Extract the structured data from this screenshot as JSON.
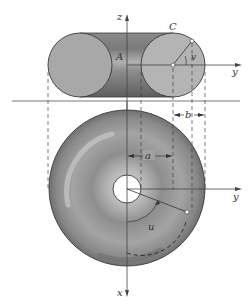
{
  "figure": {
    "type": "torus-geometry",
    "colors": {
      "surface": "#9a9a9a",
      "surface_light": "#bdbdbd",
      "surface_dark": "#6e6e6e",
      "outline": "#3a3a3a",
      "axis": "#444444",
      "background": "#ffffff"
    }
  },
  "elevation_view": {
    "labels": {
      "z_axis": "z",
      "y_axis": "y",
      "point_A": "A",
      "point_C": "C",
      "angle_v": "v"
    }
  },
  "plan_view": {
    "labels": {
      "y_axis": "y",
      "x_axis": "x",
      "dim_a": "a",
      "dim_b": "b",
      "angle_u": "u"
    }
  }
}
